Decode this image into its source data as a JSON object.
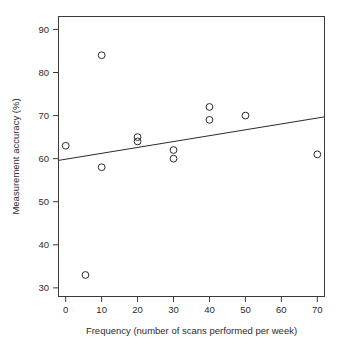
{
  "chart_data": {
    "type": "scatter",
    "title": "",
    "xlabel": "Frequency (number of scans performed per week)",
    "ylabel": "Measurement accuracy (%)",
    "xlim": [
      -2,
      72
    ],
    "ylim": [
      28,
      93
    ],
    "xticks": [
      0,
      10,
      20,
      30,
      40,
      50,
      60,
      70
    ],
    "yticks": [
      30,
      40,
      50,
      60,
      70,
      80,
      90
    ],
    "xtick_labels": [
      "0",
      "10",
      "20",
      "30",
      "40",
      "50",
      "60",
      "70"
    ],
    "ytick_labels": [
      "30",
      "40",
      "50",
      "60",
      "70",
      "80",
      "90"
    ],
    "grid": false,
    "legend": null,
    "marker": "open-circle",
    "marker_color": "#2b2b2b",
    "frame_color": "#3a3a3a",
    "background": "#ffffff",
    "points": [
      {
        "x": 0,
        "y": 63
      },
      {
        "x": 5.5,
        "y": 33
      },
      {
        "x": 10,
        "y": 84
      },
      {
        "x": 10,
        "y": 58
      },
      {
        "x": 20,
        "y": 65
      },
      {
        "x": 20,
        "y": 64
      },
      {
        "x": 30,
        "y": 62
      },
      {
        "x": 30,
        "y": 60
      },
      {
        "x": 40,
        "y": 72
      },
      {
        "x": 40,
        "y": 69
      },
      {
        "x": 50,
        "y": 70
      },
      {
        "x": 70,
        "y": 61
      }
    ],
    "series": [
      {
        "name": "Measurement accuracy",
        "x": [
          0,
          5.5,
          10,
          10,
          20,
          20,
          30,
          30,
          40,
          40,
          50,
          70
        ],
        "values": [
          63,
          33,
          84,
          58,
          65,
          64,
          62,
          60,
          72,
          69,
          70,
          61
        ]
      }
    ],
    "trendline": {
      "type": "linear-fit",
      "x_start": -2,
      "y_start": 59.6,
      "x_end": 72,
      "y_end": 69.7,
      "slope": 0.1365,
      "intercept": 59.87,
      "color": "#2b2b2b"
    }
  }
}
